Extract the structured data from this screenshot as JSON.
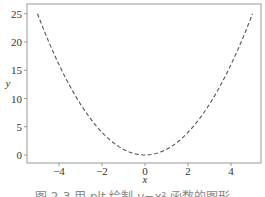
{
  "chart_data": {
    "type": "line",
    "title": "",
    "xlabel": "x",
    "ylabel": "y",
    "xlim": [
      -5.4,
      5.4
    ],
    "ylim": [
      -1.25,
      26.25
    ],
    "xticks": [
      -4,
      -2,
      0,
      2,
      4
    ],
    "yticks": [
      0,
      5,
      10,
      15,
      20,
      25
    ],
    "grid": false,
    "legend": null,
    "series": [
      {
        "name": "y = x^2",
        "style": "dashed",
        "color": "#555555",
        "x": [
          -5,
          -4.5,
          -4,
          -3.5,
          -3,
          -2.5,
          -2,
          -1.5,
          -1,
          -0.5,
          0,
          0.5,
          1,
          1.5,
          2,
          2.5,
          3,
          3.5,
          4,
          4.5,
          5
        ],
        "y": [
          25,
          20.25,
          16,
          12.25,
          9,
          6.25,
          4,
          2.25,
          1,
          0.25,
          0,
          0.25,
          1,
          2.25,
          4,
          6.25,
          9,
          12.25,
          16,
          20.25,
          25
        ]
      }
    ]
  },
  "caption": "图 2-3  用 plt 绘制 y=x² 函数的图形"
}
